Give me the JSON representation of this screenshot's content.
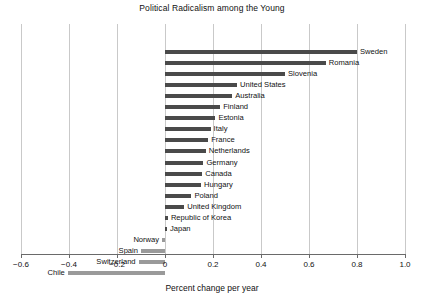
{
  "chart_data": {
    "type": "bar",
    "orientation": "horizontal",
    "title": "Political Radicalism among the Young",
    "xlabel": "Percent change per year",
    "ylabel": "",
    "xlim": [
      -0.6,
      1.0
    ],
    "xticks": [
      -0.6,
      -0.4,
      -0.2,
      0,
      0.2,
      0.4,
      0.6,
      0.8,
      1.0
    ],
    "xticklabels": [
      "−0.6",
      "−0.4",
      "−0.2",
      "0",
      "0.2",
      "0.4",
      "0.6",
      "0.8",
      "1.0"
    ],
    "grid": true,
    "grid_axis": "x",
    "legend": null,
    "categories": [
      "Sweden",
      "Romania",
      "Slovenia",
      "United States",
      "Australia",
      "Finland",
      "Estonia",
      "Italy",
      "France",
      "Netherlands",
      "Germany",
      "Canada",
      "Hungary",
      "Poland",
      "United Kingdom",
      "Republic of Korea",
      "Japan",
      "Norway",
      "Spain",
      "Switzerland",
      "Chile"
    ],
    "values": [
      0.8,
      0.67,
      0.5,
      0.3,
      0.28,
      0.23,
      0.21,
      0.19,
      0.18,
      0.17,
      0.16,
      0.155,
      0.15,
      0.11,
      0.08,
      0.012,
      0.008,
      -0.012,
      -0.1,
      -0.11,
      -0.405
    ],
    "colors": {
      "positive_bar": "#4a4a4a",
      "negative_bar": "#9a9a9a",
      "gridline": "#c9c9c9",
      "axis": "#6a6a6a",
      "text": "#111111",
      "background": "#ffffff"
    }
  }
}
